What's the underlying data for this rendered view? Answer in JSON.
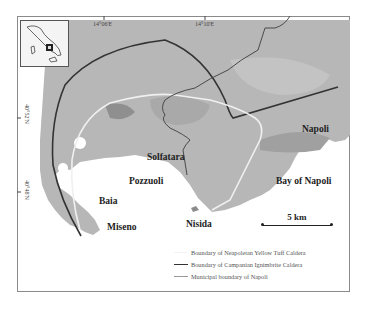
{
  "figure": {
    "type": "map",
    "region": "Campi Flegrei / Napoli area"
  },
  "axes": {
    "longitude_ticks": [
      {
        "label": "14°06'E"
      },
      {
        "label": "14°10'E"
      }
    ],
    "latitude_ticks": [
      {
        "label": "40°52'N"
      },
      {
        "label": "40°48'N"
      }
    ]
  },
  "place_labels": [
    {
      "id": "napoli",
      "label": "Napoli"
    },
    {
      "id": "solfatara",
      "label": "Solfatara"
    },
    {
      "id": "pozzuoli",
      "label": "Pozzuoli"
    },
    {
      "id": "bay",
      "label": "Bay of Napoli"
    },
    {
      "id": "baia",
      "label": "Baia"
    },
    {
      "id": "nisida",
      "label": "Nisida"
    },
    {
      "id": "miseno",
      "label": "Miseno"
    }
  ],
  "scale_bar": {
    "label": "5 km"
  },
  "legend": {
    "items": [
      {
        "label": "Boundary of Neapoletan Yellow Tuff Caldera",
        "color": "#f2f2f2",
        "style": "light line"
      },
      {
        "label": "Boundary of Campanian Ignimbrite Caldera",
        "color": "#333333",
        "style": "dark line"
      },
      {
        "label": "Municipal boundary of Napoli",
        "color": "#9a9a9a",
        "style": "grey line"
      }
    ]
  },
  "inset": {
    "label": "Italy locator",
    "marker": "study area"
  },
  "colors": {
    "land": "#b9b9b9",
    "land_dark": "#a3a3a3",
    "sea": "#ffffff",
    "ci_caldera": "#333333",
    "nyt_caldera": "#eeeeee",
    "municipal": "#4a4a4a"
  }
}
